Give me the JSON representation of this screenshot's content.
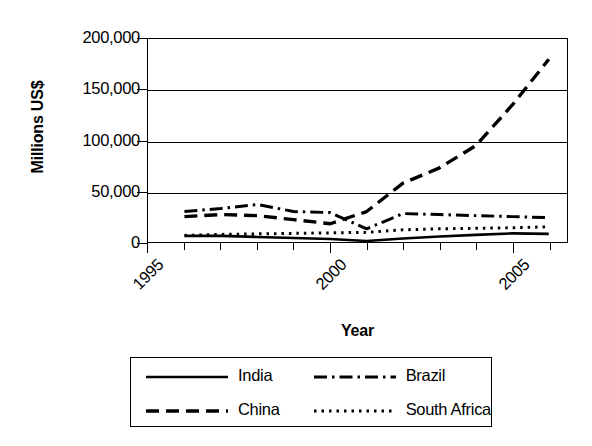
{
  "chart_data": {
    "type": "line",
    "title": "",
    "xlabel": "Year",
    "ylabel": "Millions US$",
    "xlim": [
      1995,
      2006.5
    ],
    "ylim": [
      0,
      200000
    ],
    "grid": true,
    "legend_position": "bottom",
    "y_ticks": [
      "0",
      "50,000",
      "100,000",
      "150,000",
      "200,000"
    ],
    "y_tick_values": [
      0,
      50000,
      100000,
      150000,
      200000
    ],
    "x_ticks": [
      "1995",
      "2000",
      "2005"
    ],
    "x_tick_values": [
      1995,
      2000,
      2005
    ],
    "x_minor_tick_values": [
      1996,
      1997,
      1998,
      1999,
      2001,
      2002,
      2003,
      2004,
      2006
    ],
    "x": [
      1996,
      1997,
      1998,
      1999,
      2000,
      2001,
      2002,
      2003,
      2004,
      2005,
      2006
    ],
    "series": [
      {
        "name": "India",
        "style": "solid",
        "color": "#000000",
        "values": [
          6000,
          6000,
          5000,
          4000,
          3000,
          1000,
          3500,
          5500,
          7000,
          8500,
          8000
        ]
      },
      {
        "name": "China",
        "style": "dashed",
        "color": "#000000",
        "values": [
          25000,
          27000,
          26000,
          22000,
          18000,
          30000,
          58000,
          73000,
          95000,
          135000,
          180000
        ]
      },
      {
        "name": "Brazil",
        "style": "dash-dot",
        "color": "#000000",
        "values": [
          30000,
          33000,
          37000,
          30000,
          29000,
          13000,
          28000,
          27000,
          26000,
          25000,
          24000
        ]
      },
      {
        "name": "South Africa",
        "style": "dotted",
        "color": "#000000",
        "values": [
          6500,
          7500,
          8000,
          8500,
          9000,
          9500,
          12000,
          13000,
          13500,
          14000,
          15000
        ]
      }
    ]
  },
  "legend": {
    "items": [
      {
        "label": "India",
        "style": "solid"
      },
      {
        "label": "Brazil",
        "style": "dash-dot"
      },
      {
        "label": "China",
        "style": "dashed"
      },
      {
        "label": "South Africa",
        "style": "dotted"
      }
    ]
  }
}
